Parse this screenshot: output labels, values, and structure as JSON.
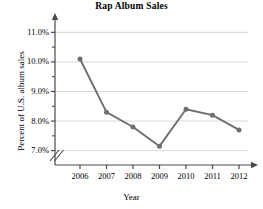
{
  "chart_data": {
    "type": "line",
    "title": "Rap Album Sales",
    "xlabel": "Year",
    "ylabel": "Percent of U.S. album sales",
    "categories": [
      "2006",
      "2007",
      "2008",
      "2009",
      "2010",
      "2011",
      "2012"
    ],
    "values": [
      10.1,
      8.3,
      7.8,
      7.15,
      8.4,
      8.2,
      7.7
    ],
    "series": [
      {
        "name": "Percent of U.S. album sales",
        "values": [
          10.1,
          8.3,
          7.8,
          7.15,
          8.4,
          8.2,
          7.7
        ]
      }
    ],
    "ylim": [
      6.75,
      11.35
    ],
    "ytick_labels": [
      "11.0%",
      "10.0%",
      "9.0%",
      "8.0%",
      "7.0%"
    ],
    "ytick_values": [
      11.0,
      10.0,
      9.0,
      8.0,
      7.0
    ],
    "yminor_values": [
      10.5,
      9.5,
      8.5,
      7.5
    ],
    "grid": true,
    "legend": false,
    "axis_break": true,
    "line_color": "#6f6f6f",
    "marker_color": "#6f6f6f",
    "grid_color": "#d9d9d9",
    "axis_color": "#4a4a4a"
  }
}
